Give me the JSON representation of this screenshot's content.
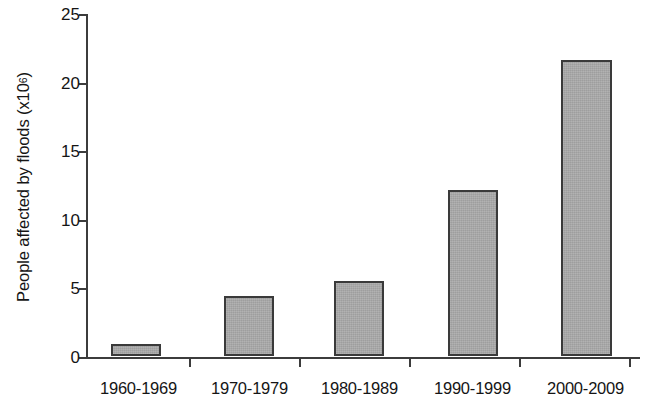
{
  "chart_data": {
    "type": "bar",
    "title": "",
    "subtitle": "",
    "xlabel": "",
    "ylabel": "People affected by floods (x10⁶)",
    "ylabel_text": "People affected by floods (x10",
    "ylabel_superscript": "6",
    "ylabel_suffix": ")",
    "categories": [
      "1960-1969",
      "1970-1979",
      "1980-1989",
      "1990-1999",
      "2000-2009"
    ],
    "values": [
      0.9,
      4.4,
      5.5,
      12.1,
      21.6
    ],
    "series": [
      {
        "name": "People affected by floods",
        "values": [
          0.9,
          4.4,
          5.5,
          12.1,
          21.6
        ]
      }
    ],
    "ylim": [
      0,
      25
    ],
    "ytick_labels": [
      "0",
      "5",
      "10",
      "15",
      "20",
      "25"
    ],
    "ytick_values": [
      0,
      5,
      10,
      15,
      20,
      25
    ],
    "grid": false,
    "legend": "none",
    "bar_fill_color": "#aaaaaa",
    "bar_border_color": "#3a3a3a",
    "axis_color": "#3c3c3c",
    "background_color": "#ffffff"
  },
  "axes": {
    "y_axis_name": "y-axis",
    "x_axis_name": "x-axis"
  }
}
